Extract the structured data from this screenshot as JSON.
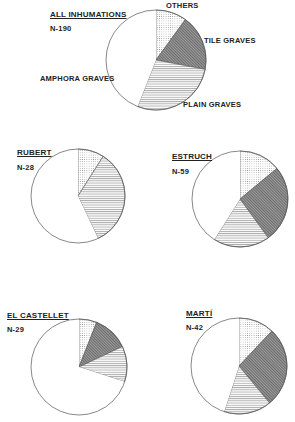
{
  "chart_data": [
    {
      "type": "pie",
      "title": "ALL INHUMATIONS",
      "n_label": "N-190",
      "n": 190,
      "categories": [
        "OTHERS",
        "TILE GRAVES",
        "PLAIN GRAVES",
        "AMPHORA GRAVES"
      ],
      "values": [
        10,
        18,
        28,
        44
      ],
      "unit": "percent (estimated)",
      "start_angle": "12 o'clock, clockwise",
      "legend_position": "slice labels around pie",
      "geometry": {
        "cx": 156,
        "cy": 60,
        "r": 50
      }
    },
    {
      "type": "pie",
      "title": "RUBERT",
      "n_label": "N-28",
      "n": 28,
      "categories": [
        "OTHERS",
        "TILE GRAVES",
        "PLAIN GRAVES",
        "AMPHORA GRAVES"
      ],
      "values": [
        9,
        0,
        34,
        57
      ],
      "unit": "percent (estimated)",
      "geometry": {
        "cx": 78,
        "cy": 196,
        "r": 47
      }
    },
    {
      "type": "pie",
      "title": "ESTRUCH",
      "n_label": "N-59",
      "n": 59,
      "categories": [
        "OTHERS",
        "TILE GRAVES",
        "PLAIN GRAVES",
        "AMPHORA GRAVES"
      ],
      "values": [
        14,
        26,
        19,
        41
      ],
      "unit": "percent (estimated)",
      "geometry": {
        "cx": 240,
        "cy": 199,
        "r": 48
      }
    },
    {
      "type": "pie",
      "title": "EL CASTELLET",
      "n_label": "N-29",
      "n": 29,
      "categories": [
        "OTHERS",
        "TILE GRAVES",
        "PLAIN GRAVES",
        "AMPHORA GRAVES"
      ],
      "values": [
        6,
        12,
        12,
        70
      ],
      "unit": "percent (estimated)",
      "geometry": {
        "cx": 79,
        "cy": 367,
        "r": 48
      }
    },
    {
      "type": "pie",
      "title": "MARTÍ",
      "n_label": "N-42",
      "n": 42,
      "categories": [
        "OTHERS",
        "TILE GRAVES",
        "PLAIN GRAVES",
        "AMPHORA GRAVES"
      ],
      "values": [
        12,
        27,
        16,
        45
      ],
      "unit": "percent (estimated)",
      "geometry": {
        "cx": 239,
        "cy": 366,
        "r": 48
      }
    }
  ],
  "labels": {
    "main_title": "ALL INHUMATIONS",
    "main_n": "N-190",
    "others": "OTHERS",
    "tile": "TILE GRAVES",
    "plain": "PLAIN GRAVES",
    "amphora": "AMPHORA GRAVES",
    "rubert_title": "RUBERT",
    "rubert_n": "N-28",
    "estruch_title": "ESTRUCH",
    "estruch_n": "N-59",
    "castellet_title": "EL CASTELLET",
    "castellet_n": "N-29",
    "marti_title": "MARTÍ",
    "marti_n": "N-42"
  },
  "patterns": {
    "OTHERS": "dotted",
    "TILE GRAVES": "dark diagonal hatch",
    "PLAIN GRAVES": "horizontal lines",
    "AMPHORA GRAVES": "blank white"
  },
  "colors": {
    "outline": "#555555",
    "tile_fill": "#8a8a8a",
    "plain_line": "#9a9a9a",
    "dot": "#888888",
    "background": "#ffffff"
  }
}
